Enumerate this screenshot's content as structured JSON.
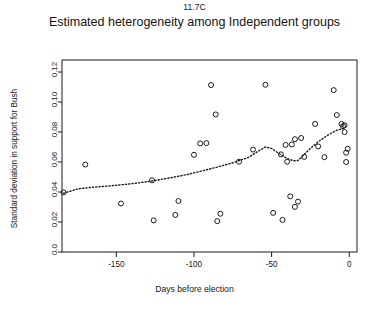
{
  "chart_data": {
    "type": "scatter",
    "title": "Estimated heterogeneity among Independent groups",
    "suptitle": "11.7C",
    "xlabel": "Days before election",
    "ylabel": "Standard deviation in support for Bush",
    "xlim": [
      -185,
      5
    ],
    "ylim": [
      0.0,
      0.128
    ],
    "xticks": [
      -150,
      -100,
      -50,
      0
    ],
    "xtick_labels": [
      "-150",
      "-100",
      "-50",
      "0"
    ],
    "yticks": [
      0.0,
      0.02,
      0.04,
      0.06,
      0.08,
      0.1,
      0.12
    ],
    "ytick_labels": [
      "0.0",
      "0.02",
      "0.04",
      "0.06",
      "0.08",
      "0.10",
      "0.12"
    ],
    "grid": false,
    "legend": "none",
    "marker": "open-circle",
    "marker_color": "#1a1a1a",
    "series": [
      {
        "name": "Independent groups",
        "points": [
          [
            -184,
            0.0397
          ],
          [
            -170,
            0.0583
          ],
          [
            -147,
            0.0323
          ],
          [
            -127,
            0.0478
          ],
          [
            -126,
            0.0211
          ],
          [
            -112,
            0.0247
          ],
          [
            -110,
            0.034
          ],
          [
            -100,
            0.0648
          ],
          [
            -96,
            0.0724
          ],
          [
            -92,
            0.0726
          ],
          [
            -89,
            0.1113
          ],
          [
            -86,
            0.0917
          ],
          [
            -85,
            0.0206
          ],
          [
            -83,
            0.0255
          ],
          [
            -71,
            0.0602
          ],
          [
            -62,
            0.0683
          ],
          [
            -54,
            0.1115
          ],
          [
            -49,
            0.0261
          ],
          [
            -44,
            0.0651
          ],
          [
            -43,
            0.0214
          ],
          [
            -41,
            0.0714
          ],
          [
            -40,
            0.0602
          ],
          [
            -38,
            0.0371
          ],
          [
            -37,
            0.0717
          ],
          [
            -35,
            0.0752
          ],
          [
            -35,
            0.0301
          ],
          [
            -33,
            0.0336
          ],
          [
            -31,
            0.076
          ],
          [
            -29,
            0.0634
          ],
          [
            -22,
            0.0854
          ],
          [
            -20,
            0.0704
          ],
          [
            -16,
            0.0632
          ],
          [
            -10,
            0.1079
          ],
          [
            -8,
            0.0913
          ],
          [
            -5,
            0.0854
          ],
          [
            -4,
            0.0839
          ],
          [
            -3,
            0.08
          ],
          [
            -3,
            0.0845
          ],
          [
            -2,
            0.0662
          ],
          [
            -2,
            0.06
          ],
          [
            -1,
            0.0688
          ]
        ]
      }
    ],
    "trend": {
      "name": "loess-smoother",
      "style": "dotted",
      "color": "#1a1a1a",
      "points": [
        [
          -184,
          0.0392
        ],
        [
          -175,
          0.042
        ],
        [
          -165,
          0.0432
        ],
        [
          -155,
          0.044
        ],
        [
          -145,
          0.045
        ],
        [
          -135,
          0.0462
        ],
        [
          -125,
          0.0477
        ],
        [
          -115,
          0.0495
        ],
        [
          -105,
          0.0515
        ],
        [
          -95,
          0.054
        ],
        [
          -85,
          0.0566
        ],
        [
          -75,
          0.0595
        ],
        [
          -65,
          0.063
        ],
        [
          -58,
          0.0676
        ],
        [
          -54,
          0.07
        ],
        [
          -50,
          0.069
        ],
        [
          -45,
          0.0655
        ],
        [
          -40,
          0.0624
        ],
        [
          -36,
          0.0608
        ],
        [
          -33,
          0.061
        ],
        [
          -30,
          0.064
        ],
        [
          -25,
          0.069
        ],
        [
          -20,
          0.0735
        ],
        [
          -14,
          0.0778
        ],
        [
          -8,
          0.0812
        ],
        [
          -3,
          0.0825
        ]
      ]
    }
  }
}
